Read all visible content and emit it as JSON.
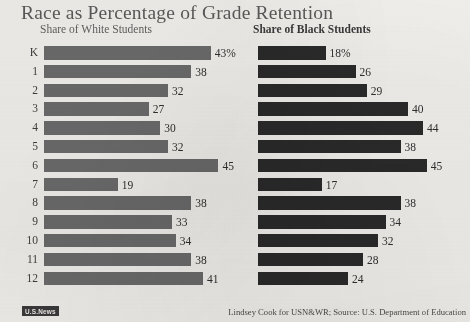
{
  "header": {
    "title": "Race as Percentage of Grade Retention"
  },
  "footer": {
    "logo_label": "U.S.News",
    "credit": "Lindsey Cook for USN&WR; Source: U.S. Department of Education"
  },
  "colors": {
    "background": "#f2f0ec",
    "title": "#5a5a5a",
    "white_students_bar": "#6b6b6b",
    "black_students_bar": "#2a2a2a"
  },
  "chart_data": {
    "type": "bar",
    "title": "Race as Percentage of Grade Retention",
    "xlabel": "",
    "ylabel": "",
    "orientation": "horizontal",
    "grid": false,
    "legend": "panel-headings",
    "xlim": [
      0,
      48
    ],
    "categories": [
      "K",
      "1",
      "2",
      "3",
      "4",
      "5",
      "6",
      "7",
      "8",
      "9",
      "10",
      "11",
      "12"
    ],
    "series": [
      {
        "name": "Share of White Students",
        "color": "#6b6b6b",
        "values": [
          43,
          38,
          32,
          27,
          30,
          32,
          45,
          19,
          38,
          33,
          34,
          38,
          41
        ],
        "labels": [
          "43%",
          "38",
          "32",
          "27",
          "30",
          "32",
          "45",
          "19",
          "38",
          "33",
          "34",
          "38",
          "41"
        ]
      },
      {
        "name": "Share of Black Students",
        "color": "#2a2a2a",
        "values": [
          18,
          26,
          29,
          40,
          44,
          38,
          45,
          17,
          38,
          34,
          32,
          28,
          24
        ],
        "labels": [
          "18%",
          "26",
          "29",
          "40",
          "44",
          "38",
          "45",
          "17",
          "38",
          "34",
          "32",
          "28",
          "24"
        ]
      }
    ]
  }
}
